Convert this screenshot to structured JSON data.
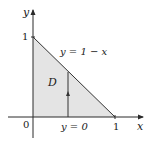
{
  "diagram": {
    "type": "region-in-plane",
    "axes": {
      "x_label": "x",
      "y_label": "y",
      "origin_label": "0",
      "x_tick_label": "1",
      "y_tick_label": "1"
    },
    "region": {
      "label": "D",
      "vertices": [
        [
          0,
          0
        ],
        [
          1,
          0
        ],
        [
          0,
          1
        ]
      ],
      "fill_color": "#e4e4e4"
    },
    "curves": {
      "upper_boundary": "y = 1 − x",
      "lower_boundary": "y = 0"
    },
    "vertical_arrow": {
      "x": 0.43,
      "direction": "up"
    },
    "colors": {
      "axis": "#2a2a2a",
      "boundary": "#333333",
      "text": "#1a1a1a"
    }
  }
}
